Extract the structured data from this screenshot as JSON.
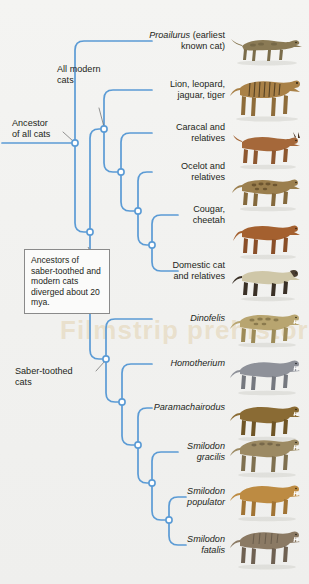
{
  "figure": {
    "type": "cladogram",
    "watermark_text": "Filmstrip prehistoric"
  },
  "colors": {
    "branch": "#5b9bd5",
    "node_fill": "#ffffff",
    "text": "#231f20",
    "background": "#f2f2f0",
    "callout_border": "#8a8a8a"
  },
  "callout": {
    "text": "Ancestors of saber-toothed and modern cats diverged about 20 mya."
  },
  "internal_labels": [
    {
      "id": "ancestor-of-all-cats",
      "text": "Ancestor\nof all cats"
    },
    {
      "id": "all-modern-cats",
      "text": "All modern\ncats"
    },
    {
      "id": "saber-toothed-cats",
      "text": "Saber-toothed\ncats"
    }
  ],
  "tips": [
    {
      "id": "proailurus",
      "name": "Proailurus",
      "qualifier": "(earliest known cat)",
      "italic": true,
      "animal": "spotted-wildcat"
    },
    {
      "id": "pantherines",
      "name": "Lion, leopard, jaguar, tiger",
      "qualifier": "",
      "italic": false,
      "animal": "tiger"
    },
    {
      "id": "caracal",
      "name": "Caracal and relatives",
      "qualifier": "",
      "italic": false,
      "animal": "caracal"
    },
    {
      "id": "ocelot",
      "name": "Ocelot and relatives",
      "qualifier": "",
      "italic": false,
      "animal": "ocelot"
    },
    {
      "id": "cougar-cheetah",
      "name": "Cougar, cheetah",
      "qualifier": "",
      "italic": false,
      "animal": "cougar"
    },
    {
      "id": "domestic-cat",
      "name": "Domestic cat and relatives",
      "qualifier": "",
      "italic": false,
      "animal": "siamese-cat"
    },
    {
      "id": "dinofelis",
      "name": "Dinofelis",
      "qualifier": "",
      "italic": true,
      "animal": "dinofelis"
    },
    {
      "id": "homotherium",
      "name": "Homotherium",
      "qualifier": "",
      "italic": true,
      "animal": "homotherium"
    },
    {
      "id": "paramachairodus",
      "name": "Paramachairodus",
      "qualifier": "",
      "italic": true,
      "animal": "paramachairodus"
    },
    {
      "id": "smilodon-gracilis",
      "name": "Smilodon gracilis",
      "qualifier": "",
      "italic": true,
      "animal": "smilodon-gracilis"
    },
    {
      "id": "smilodon-populator",
      "name": "Smilodon populator",
      "qualifier": "",
      "italic": true,
      "animal": "smilodon-populator"
    },
    {
      "id": "smilodon-fatalis",
      "name": "Smilodon fatalis",
      "qualifier": "",
      "italic": true,
      "animal": "smilodon-fatalis"
    }
  ],
  "tip_text": {
    "proailurus_line1": "Proailurus",
    "proailurus_line2": " (earliest",
    "proailurus_line3": "known cat)",
    "pantherines": "Lion, leopard,\njaguar, tiger",
    "caracal": "Caracal and\nrelatives",
    "ocelot": "Ocelot and\nrelatives",
    "cougar": "Cougar,\ncheetah",
    "domestic": "Domestic cat\nand relatives",
    "dinofelis": "Dinofelis",
    "homotherium": "Homotherium",
    "paramachairodus": "Paramachairodus",
    "smilodon_gracilis": "Smilodon\ngracilis",
    "smilodon_populator": "Smilodon\npopulator",
    "smilodon_fatalis": "Smilodon\nfatalis"
  }
}
